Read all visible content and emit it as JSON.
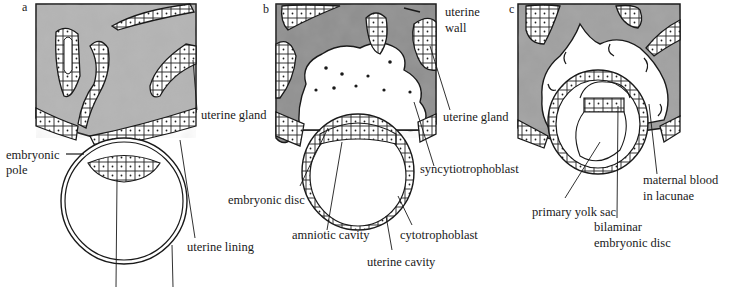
{
  "figure": {
    "panels": [
      {
        "letter": "a",
        "labels": {
          "uterine_gland": "uterine gland",
          "embryonic_pole_1": "embryonic",
          "embryonic_pole_2": "pole",
          "uterine_lining": "uterine lining"
        }
      },
      {
        "letter": "b",
        "labels": {
          "uterine_wall_1": "uterine",
          "uterine_wall_2": "wall",
          "uterine_gland": "uterine gland",
          "syncytiotrophoblast": "syncytiotrophoblast",
          "embryonic_disc": "embryonic disc",
          "amniotic_cavity": "amniotic cavity",
          "cytotrophoblast": "cytotrophoblast",
          "uterine_cavity": "uterine cavity"
        }
      },
      {
        "letter": "c",
        "labels": {
          "primary_yolk_sac": "primary yolk sac",
          "maternal_blood_1": "maternal blood",
          "maternal_blood_2": "in lacunae",
          "bilaminar_1": "bilaminar",
          "bilaminar_2": "embryonic disc"
        }
      }
    ],
    "colors": {
      "ink": "#1a1a1a",
      "tissue_shade": "#a9a9a9",
      "paper": "#ffffff"
    }
  }
}
